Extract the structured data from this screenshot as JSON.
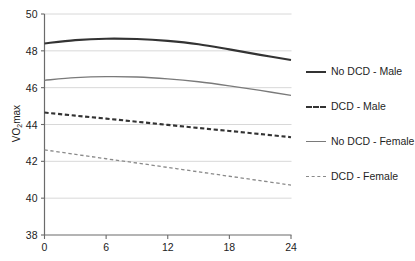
{
  "chart_data": {
    "type": "line",
    "title": "",
    "subtitle": "",
    "xlabel": "",
    "ylabel": "VO2max",
    "ylabel_display": "VO₂max",
    "xlim": [
      0,
      24
    ],
    "ylim": [
      38,
      50
    ],
    "xticks": [
      0,
      6,
      12,
      18,
      24
    ],
    "yticks": [
      38,
      40,
      42,
      44,
      46,
      48,
      50
    ],
    "xtick_labels": [
      "0",
      "6",
      "12",
      "18",
      "24"
    ],
    "ytick_labels": [
      "38",
      "40",
      "42",
      "44",
      "46",
      "48",
      "50"
    ],
    "grid": "horizontal",
    "legend_position": "right",
    "x": [
      0,
      3,
      6,
      9,
      12,
      15,
      18,
      21,
      24
    ],
    "series": [
      {
        "name": "No DCD - Male",
        "style": "solid",
        "color": "#333333",
        "width": 2.1,
        "values": [
          48.4,
          48.58,
          48.66,
          48.64,
          48.54,
          48.36,
          48.08,
          47.78,
          47.5
        ]
      },
      {
        "name": "DCD - Male",
        "style": "dashed",
        "color": "#333333",
        "width": 2.1,
        "values": [
          44.65,
          44.48,
          44.32,
          44.15,
          43.98,
          43.81,
          43.65,
          43.48,
          43.31
        ]
      },
      {
        "name": "No DCD - Female",
        "style": "solid",
        "color": "#7a7a7a",
        "width": 1.3,
        "values": [
          46.4,
          46.54,
          46.6,
          46.58,
          46.48,
          46.32,
          46.1,
          45.85,
          45.58
        ]
      },
      {
        "name": "DCD - Female",
        "style": "dashed",
        "color": "#8a8a8a",
        "width": 1.3,
        "values": [
          42.62,
          42.38,
          42.14,
          41.91,
          41.67,
          41.43,
          41.19,
          40.95,
          40.71
        ]
      }
    ]
  },
  "legend": {
    "items": [
      {
        "label": "No DCD - Male"
      },
      {
        "label": "DCD - Male"
      },
      {
        "label": "No DCD - Female"
      },
      {
        "label": "DCD - Female"
      }
    ]
  },
  "colors": {
    "axis": "#6b6b6b",
    "grid": "#d4d4d4",
    "text": "#1f1f1f",
    "background": "#ffffff"
  }
}
